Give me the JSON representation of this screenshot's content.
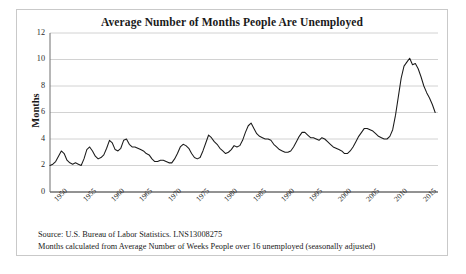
{
  "chart_data": {
    "type": "line",
    "title": "Average Number of Months People Are Unemployed",
    "xlabel": "",
    "ylabel": "Months",
    "ylim": [
      0,
      12
    ],
    "xlim": [
      1948,
      2016.5
    ],
    "ytick_values": [
      0,
      2,
      4,
      6,
      8,
      10,
      12
    ],
    "ytick_labels": [
      "0",
      "2",
      "4",
      "6",
      "8",
      "10",
      "12"
    ],
    "xtick_values": [
      1950,
      1955,
      1960,
      1965,
      1970,
      1975,
      1980,
      1985,
      1990,
      1995,
      2000,
      2005,
      2010,
      2015
    ],
    "xtick_labels": [
      "1950",
      "1955",
      "1960",
      "1965",
      "1970",
      "1975",
      "1980",
      "1985",
      "1990",
      "1995",
      "2000",
      "2005",
      "2010",
      "2015"
    ],
    "grid": true,
    "legend": false,
    "line_color": "#1a1a1a",
    "series_name": "Average months unemployed",
    "x": [
      1948.0,
      1948.5,
      1949.0,
      1949.5,
      1950.0,
      1950.5,
      1951.0,
      1951.5,
      1952.0,
      1952.5,
      1953.0,
      1953.5,
      1954.0,
      1954.5,
      1955.0,
      1955.5,
      1956.0,
      1956.5,
      1957.0,
      1957.5,
      1958.0,
      1958.5,
      1959.0,
      1959.5,
      1960.0,
      1960.5,
      1961.0,
      1961.5,
      1962.0,
      1962.5,
      1963.0,
      1963.5,
      1964.0,
      1964.5,
      1965.0,
      1965.5,
      1966.0,
      1966.5,
      1967.0,
      1967.5,
      1968.0,
      1968.5,
      1969.0,
      1969.5,
      1970.0,
      1970.5,
      1971.0,
      1971.5,
      1972.0,
      1972.5,
      1973.0,
      1973.5,
      1974.0,
      1974.5,
      1975.0,
      1975.5,
      1976.0,
      1976.5,
      1977.0,
      1977.5,
      1978.0,
      1978.5,
      1979.0,
      1979.5,
      1980.0,
      1980.5,
      1981.0,
      1981.5,
      1982.0,
      1982.5,
      1983.0,
      1983.5,
      1984.0,
      1984.5,
      1985.0,
      1985.5,
      1986.0,
      1986.5,
      1987.0,
      1987.5,
      1988.0,
      1988.5,
      1989.0,
      1989.5,
      1990.0,
      1990.5,
      1991.0,
      1991.5,
      1992.0,
      1992.5,
      1993.0,
      1993.5,
      1994.0,
      1994.5,
      1995.0,
      1995.5,
      1996.0,
      1996.5,
      1997.0,
      1997.5,
      1998.0,
      1998.5,
      1999.0,
      1999.5,
      2000.0,
      2000.5,
      2001.0,
      2001.5,
      2002.0,
      2002.5,
      2003.0,
      2003.5,
      2004.0,
      2004.5,
      2005.0,
      2005.5,
      2006.0,
      2006.5,
      2007.0,
      2007.5,
      2008.0,
      2008.5,
      2009.0,
      2009.5,
      2010.0,
      2010.5,
      2011.0,
      2011.5,
      2012.0,
      2012.5,
      2013.0,
      2013.5,
      2014.0,
      2014.5,
      2015.0,
      2015.5,
      2016.0
    ],
    "values": [
      2.0,
      2.1,
      2.3,
      2.7,
      3.1,
      2.9,
      2.4,
      2.2,
      2.1,
      2.2,
      2.1,
      2.0,
      2.5,
      3.2,
      3.4,
      3.1,
      2.7,
      2.5,
      2.6,
      2.8,
      3.3,
      3.9,
      3.7,
      3.2,
      3.1,
      3.3,
      3.9,
      4.0,
      3.6,
      3.4,
      3.4,
      3.3,
      3.2,
      3.1,
      2.9,
      2.8,
      2.5,
      2.3,
      2.3,
      2.4,
      2.4,
      2.3,
      2.2,
      2.2,
      2.5,
      2.9,
      3.4,
      3.6,
      3.5,
      3.3,
      2.9,
      2.6,
      2.5,
      2.6,
      3.1,
      3.7,
      4.3,
      4.1,
      3.8,
      3.6,
      3.3,
      3.1,
      2.9,
      3.0,
      3.2,
      3.5,
      3.4,
      3.5,
      3.9,
      4.5,
      5.0,
      5.2,
      4.8,
      4.4,
      4.2,
      4.1,
      4.0,
      4.0,
      3.9,
      3.6,
      3.4,
      3.2,
      3.1,
      3.0,
      3.0,
      3.1,
      3.4,
      3.8,
      4.2,
      4.5,
      4.5,
      4.3,
      4.1,
      4.1,
      4.0,
      3.9,
      4.1,
      4.0,
      3.8,
      3.6,
      3.4,
      3.3,
      3.2,
      3.1,
      2.9,
      2.9,
      3.1,
      3.4,
      3.8,
      4.2,
      4.5,
      4.8,
      4.8,
      4.7,
      4.6,
      4.4,
      4.2,
      4.1,
      4.0,
      4.0,
      4.2,
      4.7,
      5.8,
      7.2,
      8.6,
      9.5,
      9.8,
      10.1,
      9.6,
      9.7,
      9.3,
      8.7,
      8.0,
      7.5,
      7.1,
      6.6,
      6.0
    ],
    "footnotes": [
      "Source: U.S. Bureau of Labor Statistics.   LNS13008275",
      "Months calculated from Average Number of Weeks People over 16  unemployed (seasonally adjusted)"
    ]
  }
}
